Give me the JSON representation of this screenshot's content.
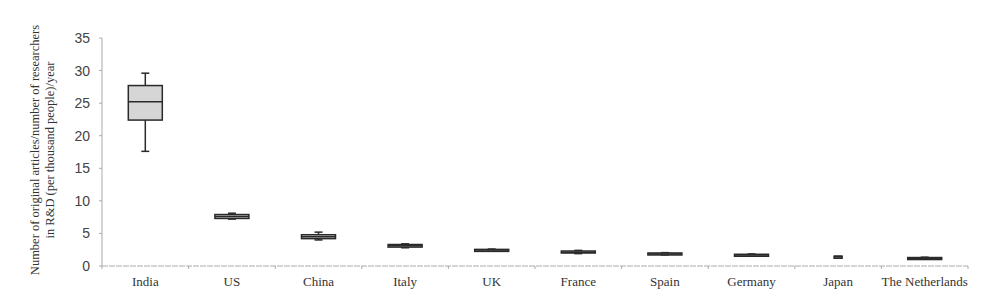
{
  "chart_data": {
    "type": "box",
    "title": "",
    "xlabel": "",
    "ylabel": "Number of original articles/number of researchers in R&D (per thousand people)/year",
    "ylabel_lines": [
      "Number of original articles/number of researchers",
      "in R&D (per thousand people)/year"
    ],
    "ylim": [
      0,
      35
    ],
    "yticks": [
      0,
      5,
      10,
      15,
      20,
      25,
      30,
      35
    ],
    "grid": false,
    "legend": null,
    "categories": [
      "India",
      "US",
      "China",
      "Italy",
      "UK",
      "France",
      "Spain",
      "Germany",
      "Japan",
      "The Netherlands"
    ],
    "boxes": [
      {
        "category": "India",
        "min": 17.6,
        "q1": 22.4,
        "median": 25.2,
        "q3": 27.7,
        "max": 29.6
      },
      {
        "category": "US",
        "min": 7.2,
        "q1": 7.3,
        "median": 7.6,
        "q3": 7.9,
        "max": 8.1
      },
      {
        "category": "China",
        "min": 4.0,
        "q1": 4.2,
        "median": 4.5,
        "q3": 4.8,
        "max": 5.2
      },
      {
        "category": "Italy",
        "min": 2.8,
        "q1": 2.9,
        "median": 3.1,
        "q3": 3.3,
        "max": 3.4
      },
      {
        "category": "UK",
        "min": 2.3,
        "q1": 2.35,
        "median": 2.45,
        "q3": 2.55,
        "max": 2.6
      },
      {
        "category": "France",
        "min": 1.9,
        "q1": 2.0,
        "median": 2.1,
        "q3": 2.3,
        "max": 2.4
      },
      {
        "category": "Spain",
        "min": 1.7,
        "q1": 1.75,
        "median": 1.85,
        "q3": 2.0,
        "max": 2.05
      },
      {
        "category": "Germany",
        "min": 1.55,
        "q1": 1.6,
        "median": 1.7,
        "q3": 1.8,
        "max": 1.85
      },
      {
        "category": "Japan",
        "min": 1.3,
        "q1": 1.35,
        "median": 1.4,
        "q3": 1.5,
        "max": 1.5
      },
      {
        "category": "The Netherlands",
        "min": 1.05,
        "q1": 1.1,
        "median": 1.2,
        "q3": 1.3,
        "max": 1.35
      }
    ],
    "colors": {
      "box_fill": "#d6d6d6",
      "box_stroke": "#2a2a2a",
      "axis": "#aaaaaa"
    }
  }
}
